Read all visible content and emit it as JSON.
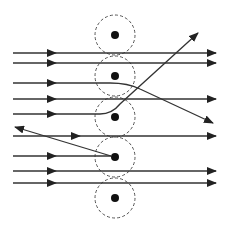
{
  "diagram": {
    "title": "",
    "colors": {
      "ray": "#333333",
      "shell": "#555555",
      "nucleus": "#111111",
      "background": "#ffffff"
    },
    "atoms": [
      {
        "id": "atom-1",
        "cx": 115,
        "cy": 35,
        "r": 20,
        "nucleus_r": 4
      },
      {
        "id": "atom-2",
        "cx": 115,
        "cy": 76,
        "r": 20,
        "nucleus_r": 4
      },
      {
        "id": "atom-3",
        "cx": 115,
        "cy": 117,
        "r": 20,
        "nucleus_r": 4
      },
      {
        "id": "atom-4",
        "cx": 115,
        "cy": 157,
        "r": 20,
        "nucleus_r": 4
      },
      {
        "id": "atom-5",
        "cx": 115,
        "cy": 198,
        "r": 20,
        "nucleus_r": 4
      }
    ],
    "rays": [
      {
        "id": "ray-1",
        "type": "straight",
        "y": 53
      },
      {
        "id": "ray-2",
        "type": "straight",
        "y": 63
      },
      {
        "id": "ray-3",
        "type": "deflected-down",
        "y": 83,
        "end": [
          213,
          123
        ]
      },
      {
        "id": "ray-4",
        "type": "straight",
        "y": 99
      },
      {
        "id": "ray-5",
        "type": "deflected-up",
        "y": 114,
        "end": [
          198,
          33
        ]
      },
      {
        "id": "ray-6",
        "type": "straight",
        "y": 136
      },
      {
        "id": "ray-7",
        "type": "back-scattered",
        "y": 156,
        "end": [
          15,
          127
        ]
      },
      {
        "id": "ray-8",
        "type": "straight",
        "y": 171
      },
      {
        "id": "ray-9",
        "type": "straight",
        "y": 183
      }
    ],
    "labels": []
  }
}
